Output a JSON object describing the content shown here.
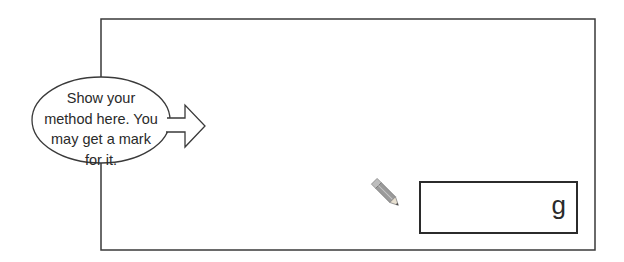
{
  "working_area": {
    "bubble": {
      "lines": [
        "Show your",
        "method here. You",
        "may get a mark",
        "for it."
      ]
    },
    "answer": {
      "value": "",
      "unit": "g"
    },
    "icons": {
      "pencil": "pencil-icon",
      "arrow": "arrow-right-icon"
    },
    "colors": {
      "border": "#3a3a3a",
      "text": "#2a2a2a",
      "background": "#ffffff"
    }
  }
}
